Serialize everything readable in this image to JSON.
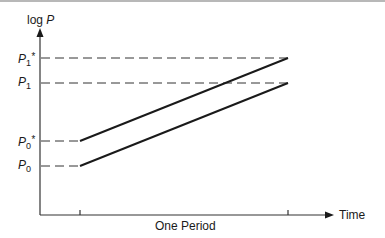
{
  "diagram": {
    "y_axis_label": {
      "prefix": "log ",
      "var": "P"
    },
    "x_axis_label": "Time",
    "period_label": "One Period",
    "levels": [
      {
        "id": "p1_star",
        "base": "P",
        "sub": "1",
        "star": "*",
        "y": 58
      },
      {
        "id": "p1",
        "base": "P",
        "sub": "1",
        "star": "",
        "y": 83
      },
      {
        "id": "p0_star",
        "base": "P",
        "sub": "0",
        "star": "*",
        "y": 141
      },
      {
        "id": "p0",
        "base": "P",
        "sub": "0",
        "star": "",
        "y": 166
      }
    ],
    "lines": [
      {
        "name": "price-path-star",
        "points": [
          [
            40,
            141
          ],
          [
            80,
            141
          ],
          [
            288,
            58
          ]
        ]
      },
      {
        "name": "price-path",
        "points": [
          [
            40,
            166
          ],
          [
            80,
            166
          ],
          [
            288,
            83
          ]
        ]
      }
    ],
    "ticks_x": [
      80,
      288
    ],
    "colors": {
      "line": "#1a1a1a",
      "dash": "#333333",
      "frame": "#b8b8b8"
    }
  }
}
